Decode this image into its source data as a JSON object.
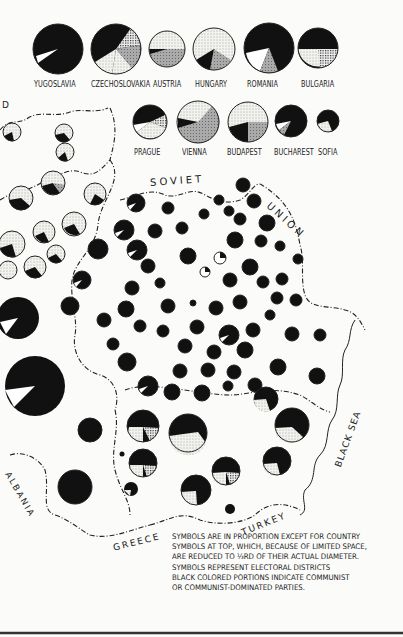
{
  "legend_country_labels": [
    "YUGOSLAVIA",
    "CZECHOSLOVAKIA",
    "AUSTRIA",
    "HUNGARY",
    "ROMANIA",
    "BULGARIA"
  ],
  "legend_city_labels": [
    "PRAGUE",
    "VIENNA",
    "BUDAPEST",
    "BUCHAREST",
    "SOFIA"
  ],
  "geo_labels": {
    "soviet": "SOVIET",
    "union": "UNION",
    "black_sea": "BLACK SEA",
    "turkey": "TURKEY",
    "greece": "GREECE",
    "albania": "ALBANIA",
    "d": "D"
  },
  "note_lines": [
    "SYMBOLS ARE IN PROPORTION EXCEPT FOR COUNTRY",
    "SYMBOLS AT TOP, WHICH, BECAUSE OF LIMITED SPACE,",
    "ARE REDUCED TO ⅓RD OF THEIR ACTUAL DIAMETER.",
    "SYMBOLS REPRESENT ELECTORAL DISTRICTS",
    "BLACK COLORED PORTIONS INDICATE COMMUNIST",
    "OR COMMUNIST-DOMINATED PARTIES."
  ],
  "colors": {
    "communist": "#111111",
    "paper": "#fbfbf9",
    "ink": "#222222"
  }
}
